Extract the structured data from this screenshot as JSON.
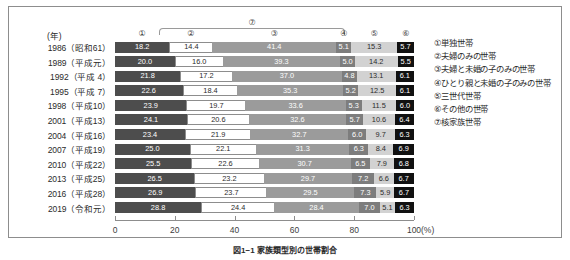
{
  "header": {
    "year_unit_label": "(年)",
    "nuclear_bracket_label": "⑦",
    "column_ids": [
      "①",
      "②",
      "③",
      "④",
      "⑤",
      "⑥"
    ]
  },
  "legend": {
    "items": [
      "①単独世帯",
      "②夫婦のみの世帯",
      "③夫婦と未婚の子のみの世帯",
      "④ひとり親と未婚の子のみの世帯",
      "⑤三世代世帯",
      "⑥その他の世帯",
      "⑦核家族世帯"
    ]
  },
  "axis": {
    "unit": "(%)",
    "ticks": [
      "0",
      "20",
      "40",
      "60",
      "80",
      "100"
    ],
    "tick_values": [
      0,
      20,
      40,
      60,
      80,
      100
    ]
  },
  "caption": "図1−1 家族類型別の世帯割合",
  "colors": {
    "series_1": "#4d4d4d",
    "series_2": "#ffffff",
    "series_3": "#9b9b9b",
    "series_4": "#7d7d7d",
    "series_5": "#d2d2d2",
    "series_6": "#111111",
    "frame": "#8d8d8d"
  },
  "chart_data": {
    "type": "bar",
    "orientation": "horizontal",
    "stacked": true,
    "title": "図1−1 家族類型別の世帯割合",
    "xlabel": "(%)",
    "ylabel": "(年)",
    "xlim": [
      0,
      100
    ],
    "grid": false,
    "legend_position": "right",
    "categories": [
      "1986（昭和61）",
      "1989（平成元）",
      "1992（平成 4）",
      "1995（平成 7）",
      "1998（平成10）",
      "2001（平成13）",
      "2004（平成16）",
      "2007（平成19）",
      "2010（平成22）",
      "2013（平成25）",
      "2016（平成28）",
      "2019（令和元）"
    ],
    "series": [
      {
        "name": "①単独世帯",
        "values": [
          18.2,
          20.0,
          21.8,
          22.6,
          23.9,
          24.1,
          23.4,
          25.0,
          25.5,
          26.5,
          26.9,
          28.8
        ]
      },
      {
        "name": "②夫婦のみの世帯",
        "values": [
          14.4,
          16.0,
          17.2,
          18.4,
          19.7,
          20.6,
          21.9,
          22.1,
          22.6,
          23.2,
          23.7,
          24.4
        ]
      },
      {
        "name": "③夫婦と未婚の子のみの世帯",
        "values": [
          41.4,
          39.3,
          37.0,
          35.3,
          33.6,
          32.6,
          32.7,
          31.3,
          30.7,
          29.7,
          29.5,
          28.4
        ]
      },
      {
        "name": "④ひとり親と未婚の子のみの世帯",
        "values": [
          5.1,
          5.0,
          4.8,
          5.2,
          5.3,
          5.7,
          6.0,
          6.3,
          6.5,
          7.2,
          7.3,
          7.0
        ]
      },
      {
        "name": "⑤三世代世帯",
        "values": [
          15.3,
          14.2,
          13.1,
          12.5,
          11.5,
          10.6,
          9.7,
          8.4,
          7.9,
          6.6,
          5.9,
          5.1
        ]
      },
      {
        "name": "⑥その他の世帯",
        "values": [
          5.7,
          5.5,
          6.1,
          6.1,
          6.0,
          6.4,
          6.3,
          6.9,
          6.8,
          6.7,
          6.7,
          6.3
        ]
      }
    ]
  }
}
